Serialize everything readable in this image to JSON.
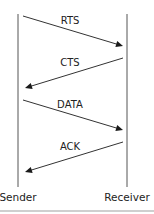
{
  "diagram": {
    "type": "sequence",
    "actors": [
      {
        "id": "sender",
        "label": "Sender"
      },
      {
        "id": "receiver",
        "label": "Receiver"
      }
    ],
    "messages": [
      {
        "label": "RTS",
        "from": "sender",
        "to": "receiver"
      },
      {
        "label": "CTS",
        "from": "receiver",
        "to": "sender"
      },
      {
        "label": "DATA",
        "from": "sender",
        "to": "receiver"
      },
      {
        "label": "ACK",
        "from": "receiver",
        "to": "sender"
      }
    ]
  }
}
